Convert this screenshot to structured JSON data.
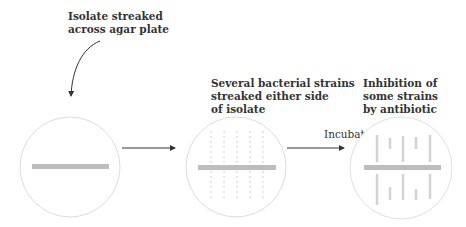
{
  "diagram": {
    "steps": [
      {
        "label_lines": [
          "Isolate streaked",
          "across agar plate"
        ]
      },
      {
        "label_lines": [
          "Several bacterial strains",
          "streaked either side",
          "of isolate"
        ]
      },
      {
        "label_lines": [
          "Inhibition of",
          "some strains",
          "by antibiotic"
        ]
      }
    ],
    "arrow_labels": {
      "incubate": "Incubate"
    },
    "colors": {
      "plate_outline": "#d9d9d9",
      "streak": "#b8b8b8",
      "strain": "#cfcfcf",
      "arrow": "#333333"
    }
  }
}
